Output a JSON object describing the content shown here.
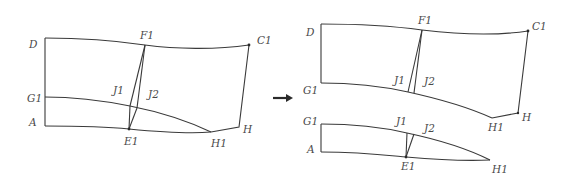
{
  "diagram": {
    "stroke_color": "#3a3a3a",
    "label_color": "#4a4a4a",
    "arrow": {
      "direction": "right",
      "symbol": "→"
    },
    "left_panel": {
      "labels": {
        "D": "D",
        "F1": "F1",
        "C1": "C1",
        "G1": "G1",
        "J1": "J1",
        "J2": "J2",
        "A": "A",
        "E1": "E1",
        "H1": "H1",
        "H": "H"
      }
    },
    "right_upper_panel": {
      "labels": {
        "D": "D",
        "F1": "F1",
        "C1": "C1",
        "G1": "G1",
        "J1": "J1",
        "J2": "J2",
        "H1": "H1",
        "H": "H"
      }
    },
    "right_lower_panel": {
      "labels": {
        "G1": "G1",
        "J1": "J1",
        "J2": "J2",
        "A": "A",
        "E1": "E1",
        "H1": "H1"
      }
    }
  }
}
